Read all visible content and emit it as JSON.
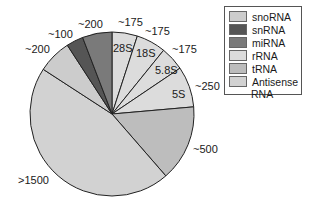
{
  "chart_data": {
    "type": "pie",
    "title": "",
    "slices": [
      {
        "label": "28S",
        "category": "rRNA",
        "value_label": "~175",
        "value": 175,
        "color": "#dcdcdc"
      },
      {
        "label": "18S",
        "category": "rRNA",
        "value_label": "~175",
        "value": 175,
        "color": "#dcdcdc"
      },
      {
        "label": "5.8S",
        "category": "rRNA",
        "value_label": "~175",
        "value": 175,
        "color": "#dcdcdc"
      },
      {
        "label": "5S",
        "category": "rRNA",
        "value_label": "~250",
        "value": 250,
        "color": "#dcdcdc"
      },
      {
        "label": "",
        "category": "tRNA",
        "value_label": "~500",
        "value": 500,
        "color": "#bdbdbd"
      },
      {
        "label": "",
        "category": "Antisense RNA",
        "value_label": ">1500",
        "value": 1500,
        "color": "#d2d2d2"
      },
      {
        "label": "",
        "category": "snoRNA",
        "value_label": "~200",
        "value": 200,
        "color": "#cccccc"
      },
      {
        "label": "",
        "category": "snRNA",
        "value_label": "~100",
        "value": 100,
        "color": "#555555"
      },
      {
        "label": "",
        "category": "miRNA",
        "value_label": "~200",
        "value": 200,
        "color": "#7a7a7a"
      }
    ],
    "legend": [
      "snoRNA",
      "snRNA",
      "miRNA",
      "rRNA",
      "tRNA",
      "Antisense RNA"
    ],
    "legend_position": "top-right"
  },
  "legend": {
    "items": [
      {
        "label": "snoRNA",
        "color": "#cccccc"
      },
      {
        "label": "snRNA",
        "color": "#555555"
      },
      {
        "label": "miRNA",
        "color": "#7a7a7a"
      },
      {
        "label": "rRNA",
        "color": "#dcdcdc"
      },
      {
        "label": "tRNA",
        "color": "#bdbdbd"
      },
      {
        "label": "Antisense",
        "color": "#d2d2d2"
      }
    ],
    "continuation": "RNA"
  },
  "labels": {
    "outer": [
      {
        "text": "~175",
        "x": 118,
        "y": 26
      },
      {
        "text": "~175",
        "x": 145,
        "y": 35
      },
      {
        "text": "~175",
        "x": 172,
        "y": 53
      },
      {
        "text": "~250",
        "x": 195,
        "y": 90
      },
      {
        "text": "~500",
        "x": 193,
        "y": 153
      },
      {
        "text": ">1500",
        "x": 18,
        "y": 184
      },
      {
        "text": "~200",
        "x": 25,
        "y": 53
      },
      {
        "text": "~100",
        "x": 48,
        "y": 38
      },
      {
        "text": "~200",
        "x": 78,
        "y": 28
      }
    ],
    "inner": [
      {
        "text": "28S",
        "x": 113,
        "y": 52
      },
      {
        "text": "18S",
        "x": 136,
        "y": 57
      },
      {
        "text": "5.8S",
        "x": 155,
        "y": 74
      },
      {
        "text": "5S",
        "x": 172,
        "y": 98
      }
    ]
  },
  "geometry": {
    "cx": 112,
    "cy": 114,
    "r": 82,
    "boundaries_deg": [
      0,
      18,
      39,
      56,
      85,
      139,
      303,
      327,
      339,
      360
    ]
  }
}
